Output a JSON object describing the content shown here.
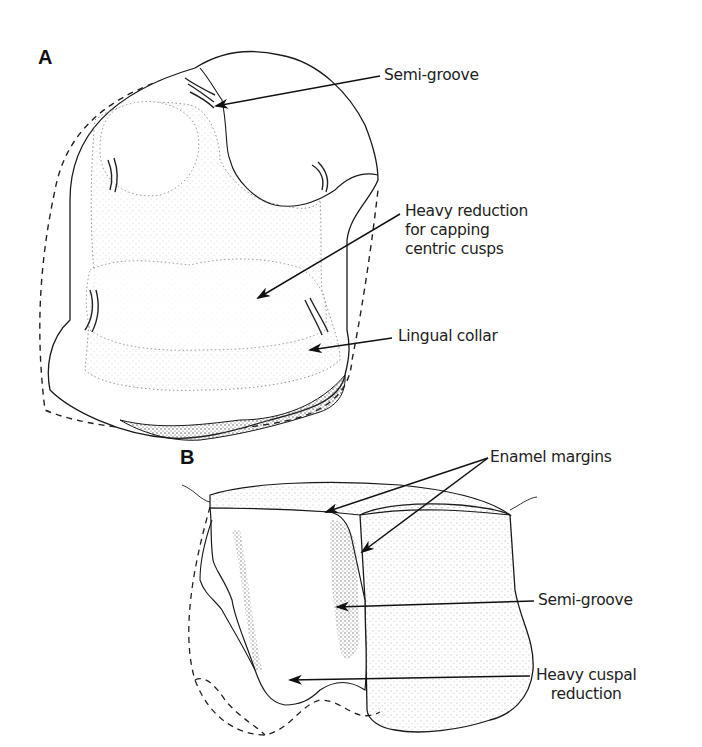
{
  "figure": {
    "panel_a": {
      "letter": "A",
      "labels": {
        "semi_groove": "Semi-groove",
        "heavy_reduction": "Heavy reduction\nfor capping\ncentric cusps",
        "lingual_collar": "Lingual collar"
      }
    },
    "panel_b": {
      "letter": "B",
      "labels": {
        "enamel_margins": "Enamel margins",
        "semi_groove": "Semi-groove",
        "heavy_cuspal_reduction": "Heavy cuspal\nreduction"
      }
    },
    "colors": {
      "line": "#1a1a1a",
      "stipple": "#555555",
      "background": "#ffffff"
    }
  }
}
